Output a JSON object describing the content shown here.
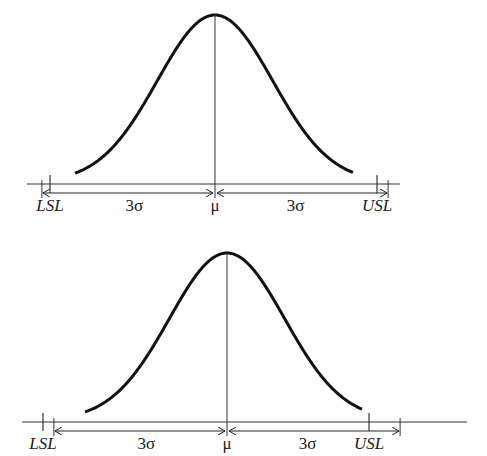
{
  "diagrams": [
    {
      "name": "centered-process",
      "labels": {
        "lsl": "LSL",
        "usl": "USL",
        "mean": "μ",
        "left_sigma": "3σ",
        "right_sigma": "3σ"
      },
      "geometry": {
        "axis_y": 184,
        "axis_x1": 27,
        "axis_x2": 400,
        "lsl_x": 50,
        "usl_x": 377,
        "mu_x": 215,
        "peak_y": 15,
        "sigma_px": 57.7,
        "tail_x1": 75,
        "tail_x2": 353
      }
    },
    {
      "name": "shifted-process",
      "labels": {
        "lsl": "LSL",
        "usl": "USL",
        "mean": "μ",
        "left_sigma": "3σ",
        "right_sigma": "3σ"
      },
      "geometry": {
        "axis_y": 422,
        "axis_x1": 22,
        "axis_x2": 467,
        "lsl_x": 43,
        "usl_x": 369,
        "mu_x": 227,
        "peak_y": 253,
        "sigma_px": 57.7,
        "tail_x1": 85,
        "tail_x2": 362
      }
    }
  ],
  "colors": {
    "curve": "#111111",
    "axis": "#333333",
    "text": "#222222"
  }
}
